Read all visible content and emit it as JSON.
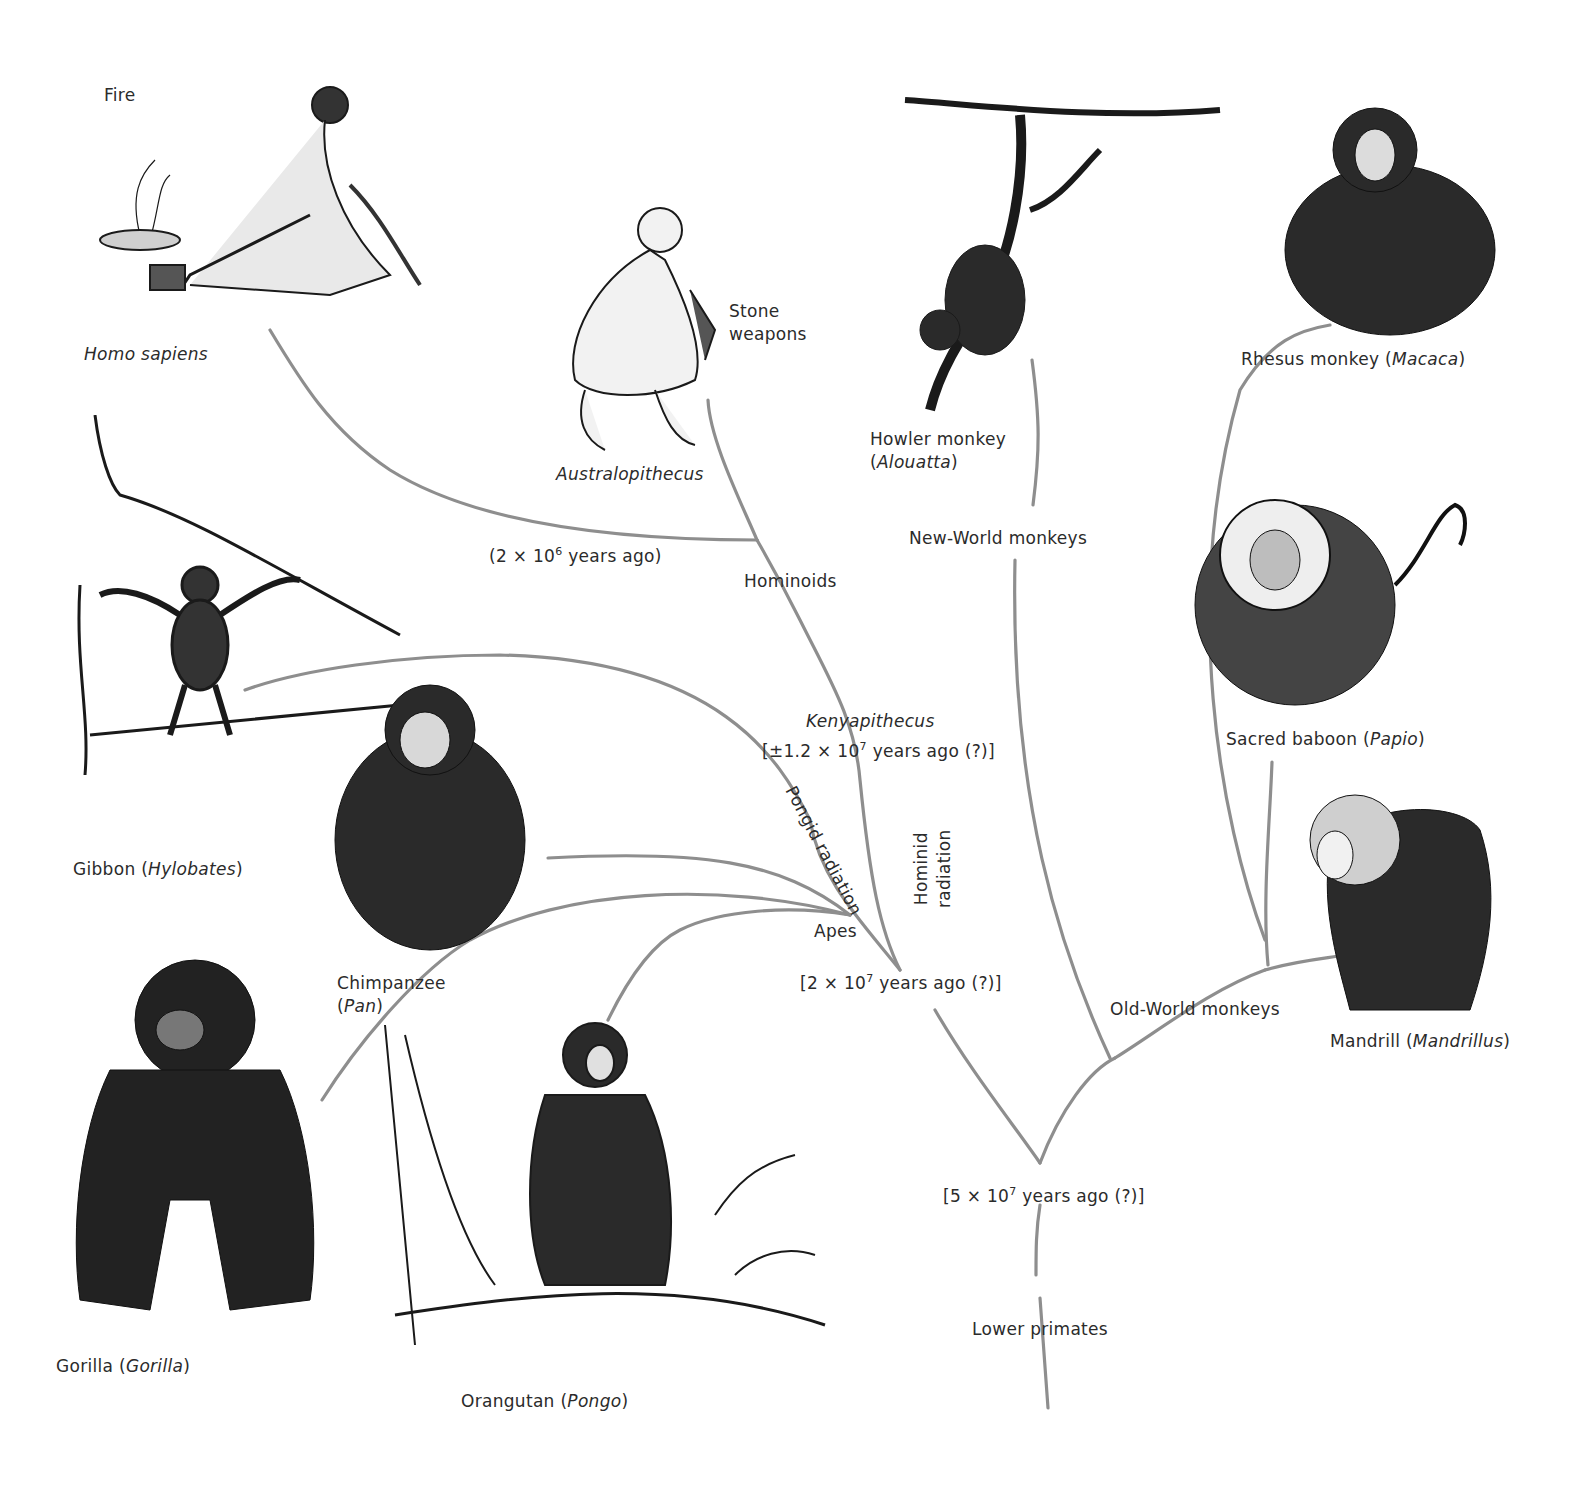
{
  "diagram": {
    "type": "phylogenetic-tree",
    "branch_color": "#8e8e8e",
    "ink_color": "#1a1a1a",
    "species": [
      {
        "id": "homo-sapiens",
        "common": "",
        "genus": "Homo sapiens"
      },
      {
        "id": "australopithecus",
        "common": "",
        "genus": "Australopithecus"
      },
      {
        "id": "howler",
        "common": "Howler monkey",
        "genus": "Alouatta"
      },
      {
        "id": "rhesus",
        "common": "Rhesus monkey",
        "genus": "Macaca"
      },
      {
        "id": "gibbon",
        "common": "Gibbon",
        "genus": "Hylobates"
      },
      {
        "id": "chimpanzee",
        "common": "Chimpanzee",
        "genus": "Pan"
      },
      {
        "id": "gorilla",
        "common": "Gorilla",
        "genus": "Gorilla"
      },
      {
        "id": "orangutan",
        "common": "Orangutan",
        "genus": "Pongo"
      },
      {
        "id": "baboon",
        "common": "Sacred baboon",
        "genus": "Papio"
      },
      {
        "id": "mandrill",
        "common": "Mandrill",
        "genus": "Mandrillus"
      }
    ],
    "annotations": {
      "fire": "Fire",
      "stone_weapons_1": "Stone",
      "stone_weapons_2": "weapons",
      "hominoid_date_pre": "(2 × 10",
      "hominoid_date_exp": "6",
      "hominoid_date_post": " years ago)",
      "hominoids": "Hominoids",
      "kenyapithecus": "Kenyapithecus",
      "kenya_date_pre": "[±1.2 × 10",
      "kenya_date_exp": "7",
      "kenya_date_post": " years ago (?)]",
      "pongid_radiation": "Pongid radiation",
      "hominid_radiation_1": "Hominid",
      "hominid_radiation_2": "radiation",
      "apes": "Apes",
      "apes_date_pre": "[2 × 10",
      "apes_date_exp": "7",
      "apes_date_post": " years ago (?)]",
      "new_world": "New-World monkeys",
      "old_world": "Old-World monkeys",
      "root_date_pre": "[5 × 10",
      "root_date_exp": "7",
      "root_date_post": " years ago (?)]",
      "lower_primates": "Lower primates"
    },
    "labels": {
      "homo_sapiens": "Homo sapiens",
      "australopithecus": "Australopithecus",
      "howler_common": "Howler monkey",
      "howler_genus": "Alouatta",
      "rhesus_common": "Rhesus monkey ",
      "rhesus_genus": "Macaca",
      "gibbon_common": "Gibbon ",
      "gibbon_genus": "Hylobates",
      "chimp_common": "Chimpanzee",
      "chimp_genus": "Pan",
      "gorilla_common": "Gorilla ",
      "gorilla_genus": "Gorilla",
      "orangutan_common": "Orangutan ",
      "orangutan_genus": "Pongo",
      "baboon_common": "Sacred baboon ",
      "baboon_genus": "Papio",
      "mandrill_common": "Mandrill ",
      "mandrill_genus": "Mandrillus"
    }
  }
}
